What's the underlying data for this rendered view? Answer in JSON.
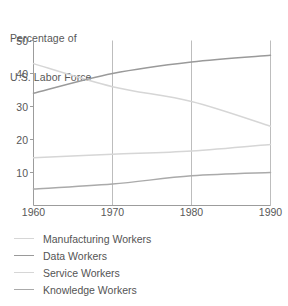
{
  "chart_data": {
    "type": "line",
    "title": "Percentage of U.S. Labor Force",
    "title_lines": [
      "Percentage of",
      "U.S. Labor Force"
    ],
    "xlabel": "",
    "ylabel": "",
    "x": [
      1960,
      1970,
      1980,
      1990
    ],
    "xtick_labels": [
      "1960",
      "1970",
      "1980",
      "1990"
    ],
    "ytick_labels": [
      "10",
      "20",
      "30",
      "40",
      "50"
    ],
    "yticks": [
      10,
      20,
      30,
      40,
      50
    ],
    "xlim": [
      1960,
      1990
    ],
    "ylim": [
      0,
      50
    ],
    "grid": "vertical-only",
    "gridlines_x": [
      1970,
      1980
    ],
    "legend_position": "below-left",
    "series": [
      {
        "name": "Manufacturing Workers",
        "color": "#d6d6d6",
        "values": [
          43.0,
          36.0,
          31.5,
          24.0
        ]
      },
      {
        "name": "Data Workers",
        "color": "#9a9a9a",
        "values": [
          34.0,
          40.0,
          43.5,
          45.5
        ]
      },
      {
        "name": "Service Workers",
        "color": "#d6d6d6",
        "values": [
          14.5,
          15.5,
          16.5,
          18.5
        ]
      },
      {
        "name": "Knowledge Workers",
        "color": "#aaaaaa",
        "values": [
          5.0,
          6.5,
          9.0,
          10.0
        ]
      }
    ]
  },
  "axis": {
    "line_color": "#9c9c9c",
    "grid_color": "#b5b5b5",
    "tick_color": "#9c9c9c"
  },
  "legend": {
    "items": [
      {
        "label": "Manufacturing Workers",
        "color": "#d6d6d6"
      },
      {
        "label": "Data Workers",
        "color": "#9a9a9a"
      },
      {
        "label": "Service Workers",
        "color": "#d6d6d6"
      },
      {
        "label": "Knowledge Workers",
        "color": "#aaaaaa"
      }
    ]
  }
}
